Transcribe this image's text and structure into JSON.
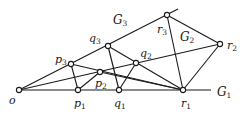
{
  "diagram": {
    "points": [
      {
        "id": "o",
        "label": "o",
        "sub": "",
        "x": 19,
        "y": 90
      },
      {
        "id": "p1",
        "label": "p",
        "sub": "1",
        "x": 78,
        "y": 90
      },
      {
        "id": "q1",
        "label": "q",
        "sub": "1",
        "x": 119,
        "y": 90
      },
      {
        "id": "r1",
        "label": "r",
        "sub": "1",
        "x": 183,
        "y": 90
      },
      {
        "id": "p2",
        "label": "p",
        "sub": "2",
        "x": 100,
        "y": 72
      },
      {
        "id": "q2",
        "label": "q",
        "sub": "2",
        "x": 136,
        "y": 63
      },
      {
        "id": "r2",
        "label": "r",
        "sub": "2",
        "x": 220,
        "y": 44
      },
      {
        "id": "p3",
        "label": "p",
        "sub": "3",
        "x": 71,
        "y": 64
      },
      {
        "id": "q3",
        "label": "q",
        "sub": "3",
        "x": 108,
        "y": 46
      },
      {
        "id": "r3",
        "label": "r",
        "sub": "3",
        "x": 167,
        "y": 15
      }
    ],
    "regions": [
      {
        "id": "G1",
        "label": "G",
        "sub": "1"
      },
      {
        "id": "G2",
        "label": "G",
        "sub": "2"
      },
      {
        "id": "G3",
        "label": "G",
        "sub": "3"
      }
    ]
  }
}
